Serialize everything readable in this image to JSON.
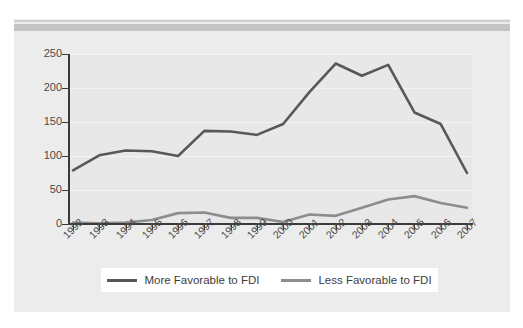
{
  "chart_data": {
    "type": "line",
    "title": "",
    "subtitle": "",
    "xlabel": "",
    "ylabel": "",
    "categories": [
      "1992",
      "1993",
      "1994",
      "1995",
      "1996",
      "1997",
      "1998",
      "1999",
      "2000",
      "2001",
      "2002",
      "2003",
      "2004",
      "2005",
      "2006",
      "2007"
    ],
    "x_tick_labels": [
      "1992",
      "1993",
      "1994",
      "1995",
      "1996",
      "1997",
      "1998",
      "1999",
      "2000",
      "2001",
      "2002",
      "2003",
      "2004",
      "2005",
      "2006",
      "2007"
    ],
    "y_tick_labels": [
      "0",
      "50",
      "100",
      "150",
      "200",
      "250"
    ],
    "y_ticks": [
      0,
      50,
      100,
      150,
      200,
      250
    ],
    "ylim": [
      0,
      250
    ],
    "xlim": [
      "1992",
      "2007"
    ],
    "grid": true,
    "grid_axis": "y",
    "legend_position": "bottom",
    "series": [
      {
        "name": "More Favorable to FDI",
        "color": "#585858",
        "values": [
          79,
          101,
          108,
          107,
          100,
          137,
          136,
          131,
          147,
          194,
          236,
          218,
          234,
          164,
          147,
          75
        ]
      },
      {
        "name": "Less Favorable to FDI",
        "color": "#8d8d8d",
        "values": [
          2,
          1,
          2,
          6,
          16,
          17,
          9,
          9,
          3,
          14,
          12,
          24,
          36,
          41,
          31,
          24
        ]
      }
    ]
  },
  "legend": {
    "entries": [
      {
        "label": "More Favorable to FDI",
        "color": "#585858"
      },
      {
        "label": "Less Favorable to FDI",
        "color": "#8d8d8d"
      }
    ]
  },
  "colors": {
    "page_background": "#ffffff",
    "panel_background": "#ececec",
    "plot_background": "#e8e8e8",
    "rule_bar": "#c4c4c4",
    "axis": "#3a3a3a",
    "gridline": "#f4f4f4",
    "tick_label": "#4a4a4a",
    "legend_background": "#ffffff"
  }
}
